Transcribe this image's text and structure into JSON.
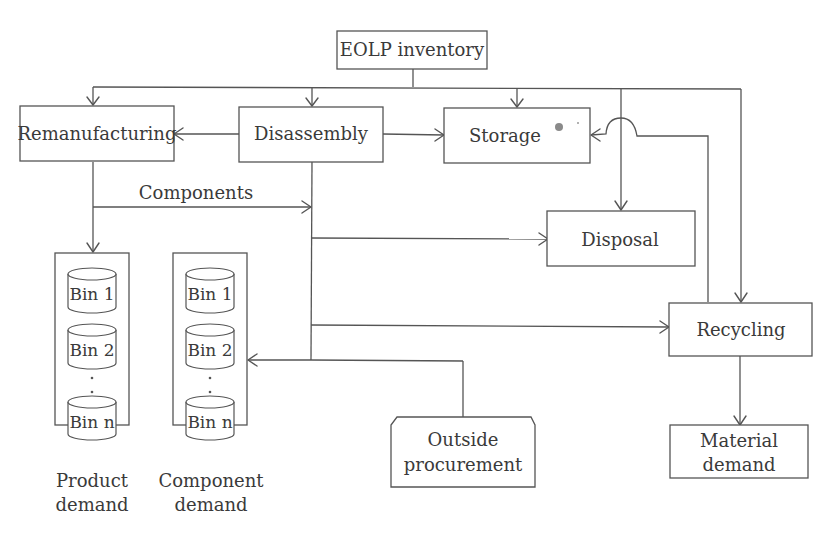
{
  "diagram": {
    "title_node": {
      "label": "EOLP inventory"
    },
    "nodes": {
      "remanufacturing": {
        "label": "Remanufacturing"
      },
      "disassembly": {
        "label": "Disassembly"
      },
      "storage": {
        "label": "Storage"
      },
      "disposal": {
        "label": "Disposal"
      },
      "recycling": {
        "label": "Recycling"
      },
      "outside_procurement": {
        "line1": "Outside",
        "line2": "procurement"
      },
      "material_demand": {
        "line1": "Material",
        "line2": "demand"
      }
    },
    "edge_labels": {
      "components": "Components"
    },
    "product_demand": {
      "bins": [
        "Bin 1",
        "Bin 2",
        "Bin n"
      ],
      "caption_line1": "Product",
      "caption_line2": "demand"
    },
    "component_demand": {
      "bins": [
        "Bin 1",
        "Bin 2",
        "Bin n"
      ],
      "caption_line1": "Component",
      "caption_line2": "demand"
    },
    "edges": [
      [
        "EOLP inventory",
        "Remanufacturing"
      ],
      [
        "EOLP inventory",
        "Disassembly"
      ],
      [
        "EOLP inventory",
        "Storage"
      ],
      [
        "EOLP inventory",
        "Disposal"
      ],
      [
        "EOLP inventory",
        "Recycling"
      ],
      [
        "Disassembly",
        "Remanufacturing"
      ],
      [
        "Disassembly",
        "Storage"
      ],
      [
        "Disassembly",
        "Disposal"
      ],
      [
        "Disassembly",
        "Recycling"
      ],
      [
        "Disassembly",
        "Component demand"
      ],
      [
        "Remanufacturing",
        "Product demand"
      ],
      [
        "Remanufacturing",
        "Disassembly (Components)"
      ],
      [
        "Outside procurement",
        "Component demand"
      ],
      [
        "Recycling",
        "Storage"
      ],
      [
        "Recycling",
        "Material demand"
      ]
    ]
  }
}
